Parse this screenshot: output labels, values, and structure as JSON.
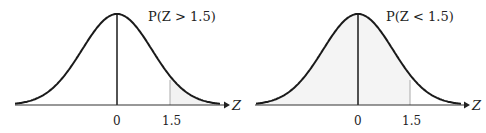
{
  "chart_data": [
    {
      "type": "area",
      "title": "P(Z > 1.5)",
      "xlabel": "Z",
      "ylabel": "",
      "x_ticks": [
        "0",
        "1.5"
      ],
      "curve": "standard normal density",
      "shaded_region": "Z > 1.5 (right tail)",
      "marker_x": 1.5,
      "xlim": [
        -3.2,
        3.2
      ],
      "grid": false,
      "legend": "none"
    },
    {
      "type": "area",
      "title": "P(Z < 1.5)",
      "xlabel": "Z",
      "ylabel": "",
      "x_ticks": [
        "0",
        "1.5"
      ],
      "curve": "standard normal density",
      "shaded_region": "Z < 1.5 (left of 1.5)",
      "marker_x": 1.5,
      "xlim": [
        -3.2,
        3.2
      ],
      "grid": false,
      "legend": "none"
    }
  ],
  "left": {
    "label": "P(Z > 1.5)",
    "axis_label": "Z",
    "tick_zero": "0",
    "tick_value": "1.5"
  },
  "right": {
    "label": "P(Z < 1.5)",
    "axis_label": "Z",
    "tick_zero": "0",
    "tick_value": "1.5"
  },
  "colors": {
    "curve": "#1a1a1a",
    "shade": "#f2f2f2",
    "marker": "#aaaaaa"
  }
}
